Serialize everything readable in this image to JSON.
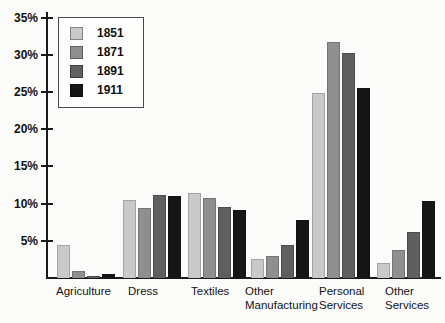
{
  "chart_data": {
    "type": "bar",
    "title": "",
    "xlabel": "",
    "ylabel": "",
    "unit": "%",
    "categories": [
      "Agriculture",
      "Dress",
      "Textiles",
      "Other Manufacturing",
      "Personal Services",
      "Other Services"
    ],
    "category_label_lines": [
      [
        "Agriculture"
      ],
      [
        "Dress"
      ],
      [
        "Textiles"
      ],
      [
        "Other",
        "Manufacturing"
      ],
      [
        "Personal",
        "Services"
      ],
      [
        "Other",
        "Services"
      ]
    ],
    "series": [
      {
        "name": "1851",
        "color": "#c9c9c9",
        "values": [
          4.4,
          10.5,
          11.4,
          2.6,
          24.8,
          2.0
        ]
      },
      {
        "name": "1871",
        "color": "#8f8f8f",
        "values": [
          1.0,
          9.4,
          10.7,
          3.0,
          31.7,
          3.8
        ]
      },
      {
        "name": "1891",
        "color": "#5f5f5f",
        "values": [
          0.3,
          11.2,
          9.6,
          4.5,
          30.2,
          6.2
        ]
      },
      {
        "name": "1911",
        "color": "#161616",
        "values": [
          0.6,
          11.0,
          9.1,
          7.8,
          25.5,
          10.4
        ]
      }
    ],
    "y_ticks": [
      "35%",
      "30%",
      "25%",
      "20%",
      "15%",
      "10%",
      "5%"
    ],
    "ylim": [
      0,
      36
    ],
    "grid": false,
    "legend_position": "top-left",
    "legend_items": [
      "1851",
      "1871",
      "1891",
      "1911"
    ]
  }
}
